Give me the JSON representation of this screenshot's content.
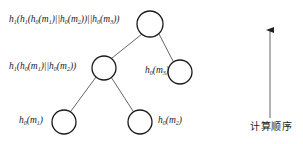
{
  "diagram": {
    "type": "hash-tree",
    "nodes": [
      {
        "id": "root",
        "label_parts": [
          "h",
          "1",
          "(h",
          "1",
          "(h",
          "0",
          "(m",
          "1",
          ")||h",
          "0",
          "(m",
          "2",
          "))||h",
          "0",
          "(m",
          "3",
          "))"
        ],
        "label_text": "h1(h1(h0(m1)||h0(m2))||h0(m3))",
        "cx": 150,
        "cy": 24,
        "r": 13
      },
      {
        "id": "mid-left",
        "label_text": "h1(h0(m1)||h0(m2))",
        "cx": 104,
        "cy": 68,
        "r": 12
      },
      {
        "id": "mid-right",
        "label_text": "h0(m3)",
        "cx": 180,
        "cy": 72,
        "r": 12
      },
      {
        "id": "leaf-left",
        "label_text": "h0(m1)",
        "cx": 64,
        "cy": 122,
        "r": 12
      },
      {
        "id": "leaf-right",
        "label_text": "h0(m2)",
        "cx": 140,
        "cy": 122,
        "r": 12
      }
    ],
    "edges": [
      {
        "from": "root",
        "to": "mid-left"
      },
      {
        "from": "root",
        "to": "mid-right"
      },
      {
        "from": "mid-left",
        "to": "leaf-left"
      },
      {
        "from": "mid-left",
        "to": "leaf-right"
      }
    ],
    "labels": {
      "root": {
        "h_outer": "h",
        "s1": "1",
        "h_mid": "(h",
        "s2": "1",
        "h_in1": "(h",
        "s3": "0",
        "m1": "(m",
        "s4": "1",
        "sep1": ")||h",
        "s5": "0",
        "m2": "(m",
        "s6": "2",
        "sep2": "))||h",
        "s7": "0",
        "m3": "(m",
        "s8": "3",
        "close": "))"
      },
      "mid_left": {
        "h_outer": "h",
        "s1": "1",
        "h_in1": "(h",
        "s2": "0",
        "m1": "(m",
        "s3": "1",
        "sep1": ")||h",
        "s4": "0",
        "m2": "(m",
        "s5": "2",
        "close": "))"
      },
      "mid_right": {
        "h": "h",
        "s1": "0",
        "m": "(m",
        "s2": "3",
        "close": ")"
      },
      "leaf_left": {
        "h": "h",
        "s1": "0",
        "m": "(m",
        "s2": "1",
        "close": ")"
      },
      "leaf_right": {
        "h": "h",
        "s1": "0",
        "m": "(m",
        "s2": "2",
        "close": ")"
      }
    },
    "arrow": {
      "direction": "up",
      "label": "计算顺序"
    },
    "colors": {
      "node_stroke": "#1a1a1a",
      "edge_stroke": "#555555",
      "text": "#222222",
      "background": "#ffffff"
    }
  }
}
